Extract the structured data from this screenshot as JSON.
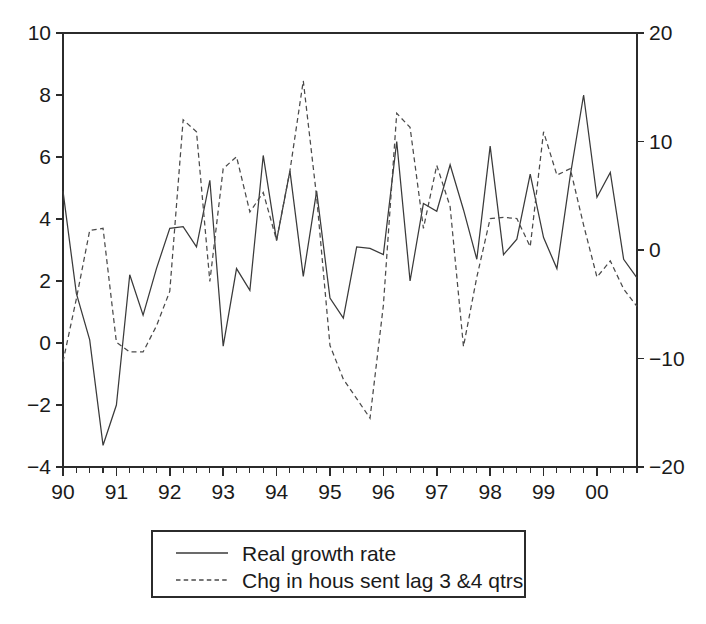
{
  "chart_data": {
    "type": "line",
    "title": "",
    "subtitle": "",
    "xlabel": "",
    "ylabel": "",
    "grid": false,
    "legend_position": "bottom-center",
    "x_axis": {
      "tick_labels": [
        "90",
        "91",
        "92",
        "93",
        "94",
        "95",
        "96",
        "97",
        "98",
        "99",
        "00"
      ],
      "tick_values": [
        1990,
        1991,
        1992,
        1993,
        1994,
        1995,
        1996,
        1997,
        1998,
        1999,
        2000
      ],
      "minor_ticks_per_interval": 4,
      "xlim": [
        1990.0,
        2000.75
      ]
    },
    "y_axis_left": {
      "tick_labels": [
        "10",
        "8",
        "6",
        "4",
        "2",
        "0",
        "-2",
        "-4"
      ],
      "tick_values": [
        10,
        8,
        6,
        4,
        2,
        0,
        -2,
        -4
      ],
      "ylim": [
        -4,
        10
      ],
      "series": "Real growth rate"
    },
    "y_axis_right": {
      "tick_labels": [
        "20",
        "10",
        "0",
        "-10",
        "-20"
      ],
      "tick_values": [
        20,
        10,
        0,
        -10,
        -20
      ],
      "ylim": [
        -20,
        20
      ],
      "series": "Chg in hous sent lag 3 &4 qtrs"
    },
    "x": [
      1990.0,
      1990.25,
      1990.5,
      1990.75,
      1991.0,
      1991.25,
      1991.5,
      1991.75,
      1992.0,
      1992.25,
      1992.5,
      1992.75,
      1993.0,
      1993.25,
      1993.5,
      1993.75,
      1994.0,
      1994.25,
      1994.5,
      1994.75,
      1995.0,
      1995.25,
      1995.5,
      1995.75,
      1996.0,
      1996.25,
      1996.5,
      1996.75,
      1997.0,
      1997.25,
      1997.5,
      1997.75,
      1998.0,
      1998.25,
      1998.5,
      1998.75,
      1999.0,
      1999.25,
      1999.5,
      1999.75,
      2000.0,
      2000.25,
      2000.5,
      2000.75
    ],
    "series": [
      {
        "name": "Real growth rate",
        "style": "solid",
        "axis": "left",
        "values": [
          4.9,
          1.6,
          0.1,
          -3.3,
          -2.0,
          2.2,
          0.9,
          2.4,
          3.7,
          3.75,
          3.1,
          5.25,
          -0.1,
          2.4,
          1.7,
          6.05,
          3.3,
          5.55,
          2.15,
          4.9,
          1.45,
          0.8,
          3.1,
          3.05,
          2.85,
          6.5,
          2.0,
          4.5,
          4.25,
          5.75,
          4.3,
          2.7,
          6.35,
          2.85,
          3.35,
          5.45,
          3.4,
          2.4,
          5.4,
          8.0,
          4.7,
          5.5,
          2.7,
          2.1
        ]
      },
      {
        "name": "Chg in hous sent lag 3 &4 qtrs",
        "style": "dashed",
        "axis": "right",
        "values": [
          -10.3,
          -4.5,
          1.8,
          2.0,
          -8.5,
          -9.4,
          -9.4,
          -7.0,
          -3.8,
          12.0,
          10.9,
          -2.9,
          7.5,
          8.6,
          3.5,
          5.3,
          0.9,
          7.3,
          15.6,
          4.9,
          -8.8,
          -11.9,
          -13.7,
          -15.5,
          -5.1,
          12.6,
          11.3,
          2.0,
          7.8,
          4.0,
          -8.9,
          -2.5,
          2.9,
          3.0,
          2.9,
          0.3,
          10.9,
          6.9,
          7.5,
          2.3,
          -2.5,
          -1.0,
          -3.6,
          -5.2
        ]
      }
    ],
    "legend": {
      "entries": [
        {
          "label": "Real growth rate",
          "style": "solid"
        },
        {
          "label": "Chg in hous sent lag 3 &4 qtrs",
          "style": "dashed"
        }
      ]
    },
    "colors": {
      "solid_series": "#3a3a3a",
      "dashed_series": "#4a4a4a",
      "axis": "#2b2b2b",
      "background": "#ffffff",
      "text": "#1a1a1a"
    }
  }
}
